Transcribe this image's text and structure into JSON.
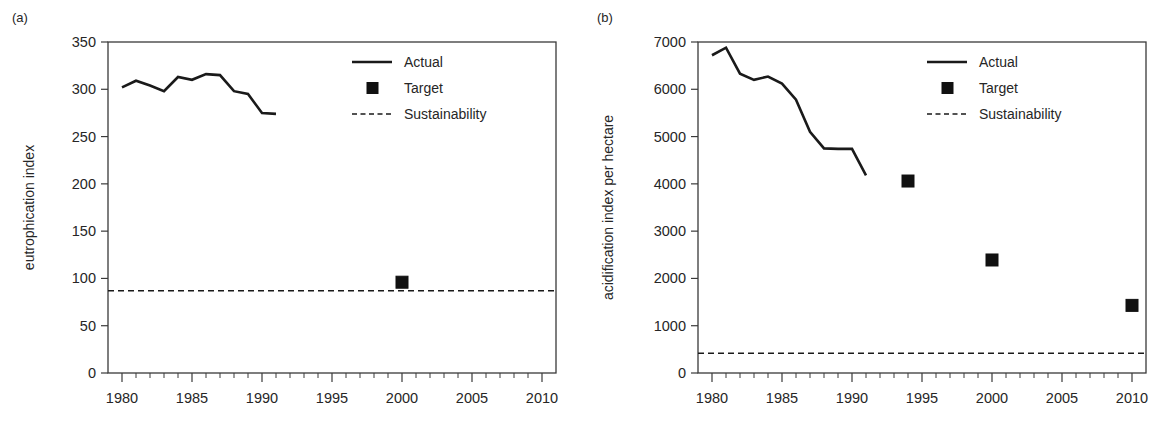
{
  "figure": {
    "panel_count": 2,
    "line_color": "#1a1a1a",
    "marker_color": "#111111",
    "axis_color": "#3a3a3a",
    "background": "#ffffff"
  },
  "chart_data": [
    {
      "type": "line",
      "panel_label": "(a)",
      "title": "",
      "xlabel": "",
      "ylabel": "eutrophication index",
      "xlim": [
        1979,
        2011
      ],
      "ylim": [
        0,
        350
      ],
      "xticks": [
        1980,
        1985,
        1990,
        1995,
        2000,
        2005,
        2010
      ],
      "xtick_labels": [
        "1980",
        "1985",
        "1990",
        "1995",
        "2000",
        "2005",
        "2010"
      ],
      "xtick_minor_step": 1,
      "yticks": [
        0,
        50,
        100,
        150,
        200,
        250,
        300,
        350
      ],
      "ytick_labels": [
        "0",
        "50",
        "100",
        "150",
        "200",
        "250",
        "300",
        "350"
      ],
      "grid": false,
      "legend_position": "upper right",
      "series": [
        {
          "name": "Actual",
          "style": "solid-line",
          "x": [
            1980,
            1981,
            1982,
            1983,
            1984,
            1985,
            1986,
            1987,
            1988,
            1989,
            1990,
            1991
          ],
          "values": [
            302,
            309,
            304,
            298,
            313,
            310,
            316,
            315,
            298,
            295,
            275,
            274
          ]
        },
        {
          "name": "Target",
          "style": "filled-square",
          "x": [
            2000
          ],
          "values": [
            96
          ]
        },
        {
          "name": "Sustainability",
          "style": "dashed-line",
          "x": [
            1979,
            2011
          ],
          "values": [
            87,
            87
          ]
        }
      ]
    },
    {
      "type": "line",
      "panel_label": "(b)",
      "title": "",
      "xlabel": "",
      "ylabel": "acidification index per hectare",
      "xlim": [
        1979,
        2011
      ],
      "ylim": [
        0,
        7000
      ],
      "xticks": [
        1980,
        1985,
        1990,
        1995,
        2000,
        2005,
        2010
      ],
      "xtick_labels": [
        "1980",
        "1985",
        "1990",
        "1995",
        "2000",
        "2005",
        "2010"
      ],
      "xtick_minor_step": 1,
      "yticks": [
        0,
        1000,
        2000,
        3000,
        4000,
        5000,
        6000,
        7000
      ],
      "ytick_labels": [
        "0",
        "1000",
        "2000",
        "3000",
        "4000",
        "5000",
        "6000",
        "7000"
      ],
      "grid": false,
      "legend_position": "upper right",
      "series": [
        {
          "name": "Actual",
          "style": "solid-line",
          "x": [
            1980,
            1981,
            1982,
            1983,
            1984,
            1985,
            1986,
            1987,
            1988,
            1989,
            1990,
            1991
          ],
          "values": [
            6720,
            6880,
            6330,
            6200,
            6270,
            6120,
            5780,
            5100,
            4750,
            4740,
            4740,
            4180
          ]
        },
        {
          "name": "Target",
          "style": "filled-square",
          "x": [
            1994,
            2000,
            2010
          ],
          "values": [
            4060,
            2390,
            1430
          ]
        },
        {
          "name": "Sustainability",
          "style": "dashed-line",
          "x": [
            1979,
            2011
          ],
          "values": [
            420,
            420
          ]
        }
      ]
    }
  ],
  "legend": {
    "items": [
      {
        "label": "Actual",
        "style": "solid-line"
      },
      {
        "label": "Target",
        "style": "filled-square"
      },
      {
        "label": "Sustainability",
        "style": "dashed-line"
      }
    ]
  }
}
